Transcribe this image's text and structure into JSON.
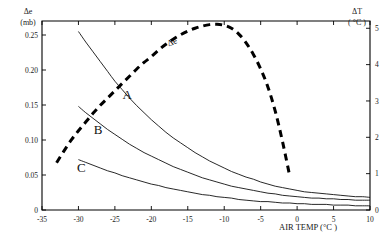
{
  "chart_data": {
    "type": "line",
    "title": "",
    "xlabel": "AIR TEMP (°C )",
    "ylabel": "Δe",
    "ylabel_unit": "(mb)",
    "y2label": "ΔT",
    "y2label_unit": "( °C )",
    "xlim": [
      -35,
      10
    ],
    "ylim": [
      0,
      0.27
    ],
    "y2lim": [
      0,
      5.2
    ],
    "grid": false,
    "legend_position": "inline-annotations",
    "xticks": [
      -35,
      -30,
      -25,
      -20,
      -15,
      -10,
      -5,
      0,
      5,
      10
    ],
    "xticklabels": [
      "-35",
      "-30",
      "-25",
      "-20",
      "-15",
      "-10",
      "-5",
      "0",
      "5",
      "10"
    ],
    "yticks": [
      0,
      0.05,
      0.1,
      0.15,
      0.2,
      0.25
    ],
    "yticklabels": [
      "0",
      "0.05",
      "0.10",
      "0.15",
      "0.20",
      "0.25"
    ],
    "y2ticks": [
      0,
      1,
      2,
      3,
      4,
      5
    ],
    "y2ticklabels": [
      "0",
      "1",
      "2",
      "3",
      "4",
      "5"
    ],
    "annotations": [
      {
        "text": "Δe",
        "x": -17.0,
        "y2": 4.55,
        "name": "delta-e-curve-label"
      },
      {
        "text": "A",
        "x": -23.3,
        "y": 0.158,
        "name": "curve-a-label"
      },
      {
        "text": "B",
        "x": -27.3,
        "y": 0.108,
        "name": "curve-b-label"
      },
      {
        "text": "C",
        "x": -29.6,
        "y": 0.055,
        "name": "curve-c-label"
      }
    ],
    "series": [
      {
        "name": "Δe",
        "axis": "right",
        "style": "dashed",
        "x": [
          -33.0,
          -32.0,
          -31.0,
          -30.0,
          -29.0,
          -28.0,
          -27.0,
          -26.0,
          -25.0,
          -24.0,
          -23.0,
          -22.0,
          -21.0,
          -20.0,
          -19.0,
          -18.0,
          -17.0,
          -16.0,
          -15.0,
          -14.0,
          -13.0,
          -12.0,
          -11.0,
          -10.0,
          -9.0,
          -8.0,
          -7.0,
          -6.0,
          -5.0,
          -4.0,
          -3.0,
          -2.0,
          -1.0
        ],
        "values": [
          1.3,
          1.62,
          1.92,
          2.18,
          2.42,
          2.66,
          2.88,
          3.08,
          3.28,
          3.48,
          3.68,
          3.88,
          4.06,
          4.22,
          4.4,
          4.56,
          4.7,
          4.82,
          4.92,
          5.0,
          5.06,
          5.1,
          5.11,
          5.08,
          5.0,
          4.84,
          4.6,
          4.28,
          3.88,
          3.38,
          2.72,
          1.88,
          0.92
        ]
      },
      {
        "name": "A",
        "axis": "left",
        "style": "solid",
        "x": [
          -30.0,
          -29.0,
          -28.0,
          -27.0,
          -26.0,
          -25.0,
          -24.0,
          -23.0,
          -22.0,
          -21.0,
          -20.0,
          -19.0,
          -18.0,
          -17.0,
          -16.0,
          -15.0,
          -14.0,
          -13.0,
          -12.0,
          -11.0,
          -10.0,
          -9.0,
          -8.0,
          -7.0,
          -6.0,
          -5.0,
          -4.0,
          -3.0,
          -2.0,
          -1.0,
          0.0,
          1.0,
          2.0,
          3.0,
          4.0,
          5.0,
          6.0,
          7.0,
          8.0,
          9.0,
          10.0
        ],
        "values": [
          0.255,
          0.24,
          0.226,
          0.212,
          0.198,
          0.184,
          0.172,
          0.16,
          0.149,
          0.139,
          0.129,
          0.12,
          0.111,
          0.103,
          0.096,
          0.089,
          0.082,
          0.076,
          0.07,
          0.065,
          0.06,
          0.055,
          0.051,
          0.047,
          0.044,
          0.04,
          0.037,
          0.034,
          0.032,
          0.03,
          0.028,
          0.026,
          0.025,
          0.024,
          0.023,
          0.022,
          0.021,
          0.02,
          0.019,
          0.019,
          0.018
        ]
      },
      {
        "name": "B",
        "axis": "left",
        "style": "solid",
        "x": [
          -30.0,
          -29.0,
          -28.0,
          -27.0,
          -26.0,
          -25.0,
          -24.0,
          -23.0,
          -22.0,
          -21.0,
          -20.0,
          -19.0,
          -18.0,
          -17.0,
          -16.0,
          -15.0,
          -14.0,
          -13.0,
          -12.0,
          -11.0,
          -10.0,
          -9.0,
          -8.0,
          -7.0,
          -6.0,
          -5.0,
          -4.0,
          -3.0,
          -2.0,
          -1.0,
          0.0,
          1.0,
          2.0,
          3.0,
          4.0,
          5.0,
          6.0,
          7.0,
          8.0,
          9.0,
          10.0
        ],
        "values": [
          0.148,
          0.139,
          0.131,
          0.123,
          0.115,
          0.108,
          0.101,
          0.094,
          0.088,
          0.082,
          0.077,
          0.072,
          0.067,
          0.062,
          0.058,
          0.054,
          0.05,
          0.046,
          0.043,
          0.04,
          0.037,
          0.034,
          0.032,
          0.03,
          0.028,
          0.026,
          0.024,
          0.023,
          0.021,
          0.02,
          0.019,
          0.018,
          0.017,
          0.017,
          0.016,
          0.016,
          0.015,
          0.015,
          0.014,
          0.014,
          0.014
        ]
      },
      {
        "name": "C",
        "axis": "left",
        "style": "solid",
        "x": [
          -30.0,
          -29.0,
          -28.0,
          -27.0,
          -26.0,
          -25.0,
          -24.0,
          -23.0,
          -22.0,
          -21.0,
          -20.0,
          -19.0,
          -18.0,
          -17.0,
          -16.0,
          -15.0,
          -14.0,
          -13.0,
          -12.0,
          -11.0,
          -10.0,
          -9.0,
          -8.0,
          -7.0,
          -6.0,
          -5.0,
          -4.0,
          -3.0,
          -2.0,
          -1.0,
          0.0,
          1.0,
          2.0,
          3.0,
          4.0,
          5.0,
          6.0,
          7.0,
          8.0,
          9.0,
          10.0
        ],
        "values": [
          0.072,
          0.068,
          0.064,
          0.06,
          0.056,
          0.053,
          0.049,
          0.046,
          0.043,
          0.04,
          0.037,
          0.035,
          0.032,
          0.03,
          0.028,
          0.026,
          0.024,
          0.022,
          0.021,
          0.019,
          0.018,
          0.017,
          0.015,
          0.014,
          0.013,
          0.012,
          0.012,
          0.011,
          0.01,
          0.01,
          0.009,
          0.009,
          0.008,
          0.008,
          0.008,
          0.007,
          0.007,
          0.007,
          0.006,
          0.006,
          0.006
        ]
      }
    ]
  }
}
